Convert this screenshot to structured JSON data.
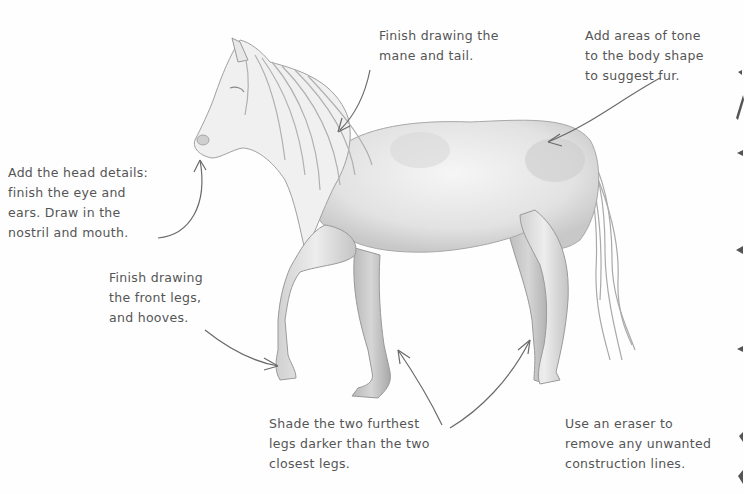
{
  "figure": {
    "stroke_color": "#555555",
    "shading_color": "#b5b5b5"
  },
  "annotations": [
    {
      "id": "mane-tail",
      "text": "Finish drawing the\nmane and tail."
    },
    {
      "id": "body-tone",
      "text": "Add areas of tone\nto the body shape\nto suggest fur."
    },
    {
      "id": "head-details",
      "text": "Add the head details:\nfinish the eye and\nears. Draw in the\nnostril and mouth."
    },
    {
      "id": "front-legs",
      "text": "Finish drawing\nthe front legs,\nand hooves."
    },
    {
      "id": "shade-legs",
      "text": "Shade the two furthest\nlegs darker than the two\nclosest legs."
    },
    {
      "id": "eraser",
      "text": "Use an eraser to\nremove any unwanted\nconstruction lines."
    }
  ]
}
